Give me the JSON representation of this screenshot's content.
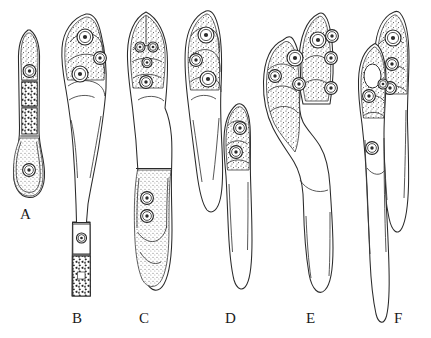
{
  "figure": {
    "kind": "scientific-line-drawing-plate",
    "background_color": "#ffffff",
    "ink_color": "#2a2a2a",
    "panel_count": 6
  },
  "labels": [
    {
      "text": "A",
      "x": 20,
      "y": 206
    },
    {
      "text": "B",
      "x": 72,
      "y": 310
    },
    {
      "text": "C",
      "x": 139,
      "y": 310
    },
    {
      "text": "D",
      "x": 225,
      "y": 310
    },
    {
      "text": "E",
      "x": 306,
      "y": 310
    },
    {
      "text": "F",
      "x": 394,
      "y": 310
    }
  ],
  "specimens": [
    {
      "id": "A",
      "label": "A",
      "nuclei_count": 2,
      "granular_segments": 2,
      "septa": 3,
      "note": "Narrow elongate cell; stippled apex with one nucleus, two boxed compartments containing dark granular masses, swollen basal cell with one nucleus."
    },
    {
      "id": "B",
      "label": "B",
      "nuclei_count": 4,
      "granular_segments": 1,
      "septa": 2,
      "note": "Large curved body; three nuclei in stippled apical head, long smooth midsection, narrow basal stalk with a nucleated cell above a dark granular base."
    },
    {
      "id": "C",
      "label": "C",
      "nuclei_count": 6,
      "granular_segments": 0,
      "septa": 1,
      "note": "Symmetrical spindle; paired bilateral nuclei at apex with two more on the midline, and two stacked nuclei in the lower stippled region."
    },
    {
      "id": "D",
      "label": "D",
      "nuclei_count": 5,
      "granular_segments": 0,
      "septa": 0,
      "note": "Compound figure: upper lobe with three diagonally arranged nuclei, and a separate overlapping lower lobe with two nuclei and a long tapering tail."
    },
    {
      "id": "E",
      "label": "E",
      "nuclei_count": 7,
      "granular_segments": 0,
      "septa": 0,
      "note": "Broad hooked head of several overlapping stippled lobes crowded with nuclei, narrowing abruptly into a long blunt tail."
    },
    {
      "id": "F",
      "label": "F",
      "nuclei_count": 6,
      "granular_segments": 0,
      "septa": 0,
      "note": "Two overlapping elongate cells with stippled ring-shaped heads containing nuclei, each tapering into a long pointed tail."
    }
  ]
}
